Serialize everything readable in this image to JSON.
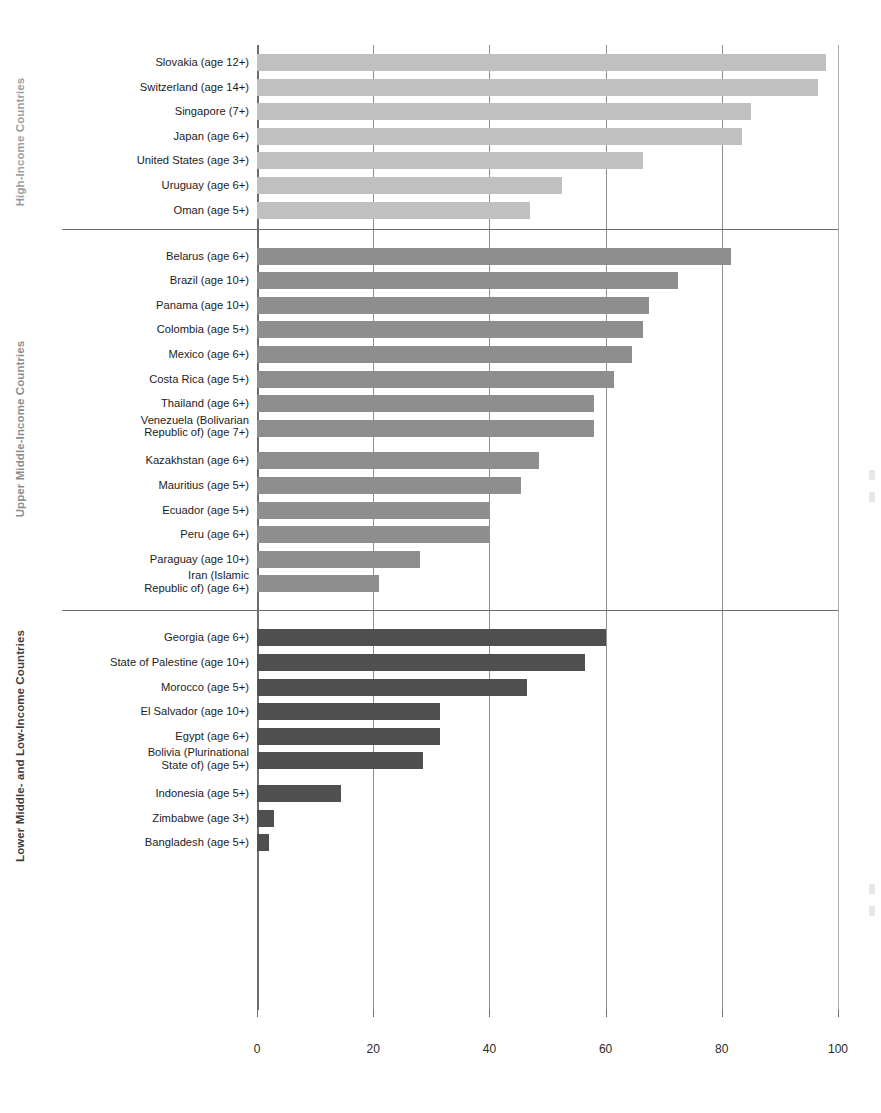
{
  "chart_data": {
    "type": "bar",
    "orientation": "horizontal",
    "title": "",
    "xlabel": "",
    "ylabel": "",
    "xlim": [
      0,
      100
    ],
    "xticks": [
      0,
      20,
      40,
      60,
      80,
      100
    ],
    "xtick_labels": [
      "0",
      "20",
      "40",
      "60",
      "80",
      "100"
    ],
    "grid": "vertical",
    "legend": "none",
    "groups": [
      {
        "name": "High-Income Countries",
        "color": "#c0c0c0",
        "categories": [
          "Slovakia (age 12+)",
          "Switzerland (age 14+)",
          "Singapore (7+)",
          "Japan (age 6+)",
          "United States (age 3+)",
          "Uruguay (age 6+)",
          "Oman (age 5+)"
        ],
        "values": [
          98,
          96.5,
          85,
          83.5,
          66.5,
          52.5,
          47
        ]
      },
      {
        "name": "Upper Middle-Income Countries",
        "color": "#8e8e8e",
        "categories": [
          "Belarus (age 6+)",
          "Brazil (age 10+)",
          "Panama (age 10+)",
          "Colombia (age 5+)",
          "Mexico (age 6+)",
          "Costa Rica (age 5+)",
          "Thailand (age 6+)",
          "Venezuela (Bolivarian\nRepublic of) (age 7+)",
          "Kazakhstan (age 6+)",
          "Mauritius (age 5+)",
          "Ecuador (age 5+)",
          "Peru (age 6+)",
          "Paraguay (age 10+)",
          "Iran (Islamic\nRepublic of) (age 6+)"
        ],
        "values": [
          81.5,
          72.5,
          67.5,
          66.5,
          64.5,
          61.5,
          58,
          58,
          48.5,
          45.5,
          40,
          40,
          28,
          21
        ]
      },
      {
        "name": "Lower Middle- and Low-Income Countries",
        "color": "#4f4f4f",
        "categories": [
          "Georgia (age 6+)",
          "State of Palestine (age 10+)",
          "Morocco (age 5+)",
          "El Salvador (age 10+)",
          "Egypt (age 6+)",
          "Bolivia (Plurinational\nState of) (age 5+)",
          "Indonesia (age 5+)",
          "Zimbabwe (age 3+)",
          "Bangladesh (age 5+)"
        ],
        "values": [
          60,
          56.5,
          46.5,
          31.5,
          31.5,
          28.5,
          14.5,
          3,
          2
        ]
      }
    ]
  },
  "axis": {
    "tick_labels": [
      "0",
      "20",
      "40",
      "60",
      "80",
      "100"
    ]
  },
  "group_labels": {
    "high": "High-Income Countries",
    "mid": "Upper Middle-Income Countries",
    "low": "Lower Middle- and Low-Income Countries"
  },
  "caption": ""
}
